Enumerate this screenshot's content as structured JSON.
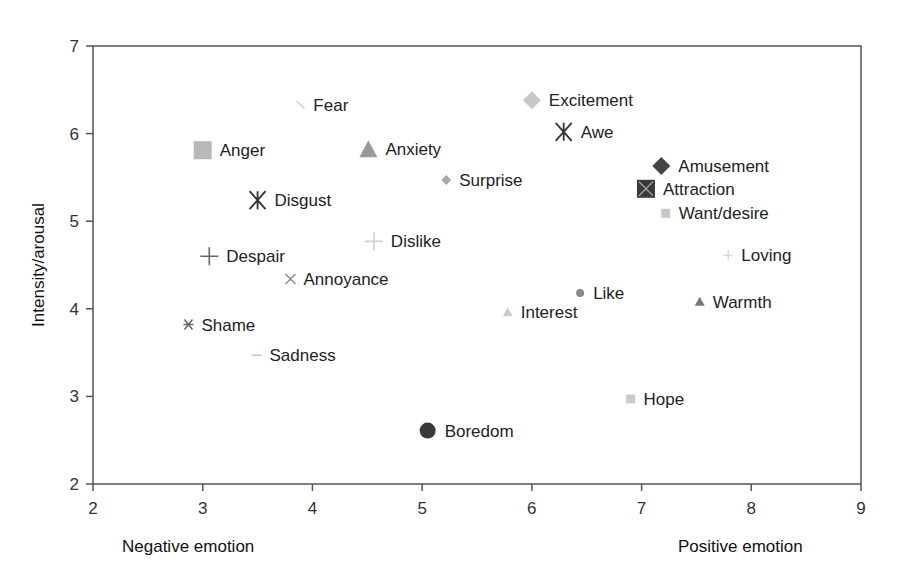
{
  "chart_data": {
    "type": "scatter",
    "title": "",
    "xlabel": "",
    "ylabel": "Intensity/arousal",
    "xlim": [
      2,
      9
    ],
    "ylim": [
      2,
      7
    ],
    "xticks": [
      2,
      3,
      4,
      5,
      6,
      7,
      8,
      9
    ],
    "yticks": [
      2,
      3,
      4,
      5,
      6,
      7
    ],
    "grid": false,
    "legend": "none (points labeled directly)",
    "annotations": {
      "x_left": "Negative emotion",
      "x_right": "Positive emotion"
    },
    "points": [
      {
        "label": "Fear",
        "x": 3.89,
        "y": 6.33,
        "marker": "x-small",
        "color": "#cfcfcf"
      },
      {
        "label": "Excitement",
        "x": 6.0,
        "y": 6.38,
        "marker": "diamond",
        "color": "#c8c8c8"
      },
      {
        "label": "Awe",
        "x": 6.29,
        "y": 6.02,
        "marker": "asterisk",
        "color": "#333333"
      },
      {
        "label": "Anger",
        "x": 3.0,
        "y": 5.81,
        "marker": "square",
        "color": "#b8b8b8"
      },
      {
        "label": "Anxiety",
        "x": 4.51,
        "y": 5.82,
        "marker": "triangle",
        "color": "#9a9a9a"
      },
      {
        "label": "Amusement",
        "x": 7.18,
        "y": 5.63,
        "marker": "diamond",
        "color": "#444444"
      },
      {
        "label": "Surprise",
        "x": 5.22,
        "y": 5.47,
        "marker": "diamond-small",
        "color": "#a8a8a8"
      },
      {
        "label": "Attraction",
        "x": 7.04,
        "y": 5.37,
        "marker": "square-x",
        "color": "#3a3a3a"
      },
      {
        "label": "Disgust",
        "x": 3.5,
        "y": 5.24,
        "marker": "asterisk",
        "color": "#333333"
      },
      {
        "label": "Want/desire",
        "x": 7.22,
        "y": 5.09,
        "marker": "square-small",
        "color": "#c8c8c8"
      },
      {
        "label": "Dislike",
        "x": 4.56,
        "y": 4.77,
        "marker": "plus",
        "color": "#d0d0d0"
      },
      {
        "label": "Despair",
        "x": 3.06,
        "y": 4.6,
        "marker": "plus",
        "color": "#666666"
      },
      {
        "label": "Loving",
        "x": 7.79,
        "y": 4.61,
        "marker": "plus-small",
        "color": "#d8d8d8"
      },
      {
        "label": "Annoyance",
        "x": 3.8,
        "y": 4.34,
        "marker": "x",
        "color": "#888888"
      },
      {
        "label": "Like",
        "x": 6.44,
        "y": 4.18,
        "marker": "circle-small",
        "color": "#888888"
      },
      {
        "label": "Warmth",
        "x": 7.53,
        "y": 4.08,
        "marker": "triangle-small",
        "color": "#777777"
      },
      {
        "label": "Interest",
        "x": 5.78,
        "y": 3.96,
        "marker": "triangle-small",
        "color": "#cccccc"
      },
      {
        "label": "Shame",
        "x": 2.87,
        "y": 3.82,
        "marker": "asterisk-small",
        "color": "#666666"
      },
      {
        "label": "Sadness",
        "x": 3.49,
        "y": 3.47,
        "marker": "dash",
        "color": "#c8c8c8"
      },
      {
        "label": "Hope",
        "x": 6.9,
        "y": 2.97,
        "marker": "square-small",
        "color": "#cccccc"
      },
      {
        "label": "Boredom",
        "x": 5.05,
        "y": 2.61,
        "marker": "circle",
        "color": "#3a3a3a"
      }
    ]
  },
  "labels": {
    "ylabel": "Intensity/arousal",
    "x_left": "Negative emotion",
    "x_right": "Positive emotion"
  }
}
